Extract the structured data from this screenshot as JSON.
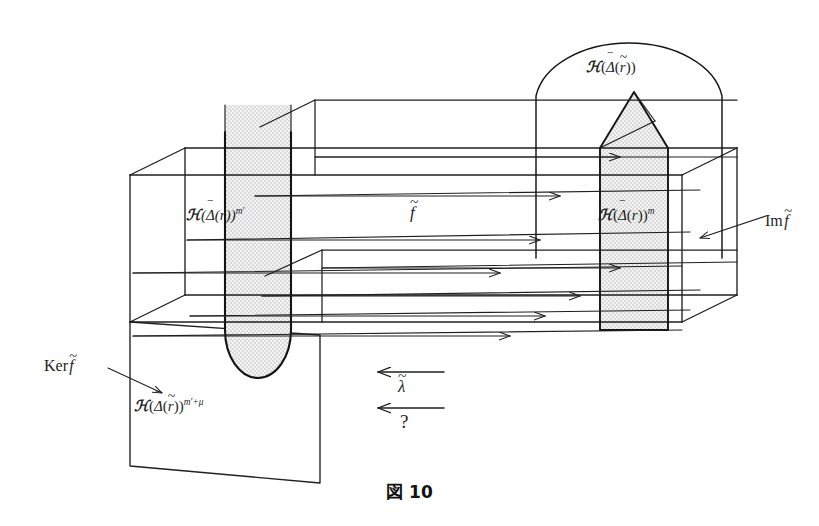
{
  "figure": {
    "caption": "図 10",
    "caption_number": "10",
    "caption_prefix": "図",
    "background_color": "#ffffff",
    "ink_color": "#1f1f1f",
    "shade_color": "#e3e3e3"
  },
  "labels": {
    "left_slab": {
      "script": "ℋ",
      "open": "(",
      "delta": "Δ",
      "delta_accent": "‾",
      "inner_open": "(",
      "r": "r",
      "r_accent": "",
      "inner_close": ")",
      "close": ")",
      "exponent": "m′",
      "plain": "ℋ(Δ̄(r))^{m′}"
    },
    "right_slab": {
      "script": "ℋ",
      "delta": "Δ",
      "delta_accent": "‾",
      "r": "r",
      "r_accent": "",
      "exponent": "m",
      "plain": "ℋ(Δ̄(r))^{m}"
    },
    "arch": {
      "script": "ℋ",
      "delta": "Δ",
      "delta_accent": "‾",
      "r": "r",
      "r_accent": "~",
      "exponent": "",
      "plain": "ℋ(Δ̄(r̃))"
    },
    "kernel_plane": {
      "script": "ℋ",
      "delta": "Δ",
      "delta_accent": "‾",
      "r": "r",
      "r_accent": "~",
      "exponent": "m′+μ",
      "plain": "ℋ(Δ̄(r̃))^{m′+μ}"
    },
    "map_f": {
      "symbol": "f",
      "accent": "~",
      "plain": "f̃"
    },
    "ker": {
      "word": "Ker",
      "symbol": "f",
      "accent": "~",
      "plain": "Ker f̃"
    },
    "im": {
      "word": "Im",
      "symbol": "f",
      "accent": "~",
      "plain": "Im f̃"
    },
    "lambda": {
      "symbol": "λ",
      "accent": "~",
      "plain": "λ̃"
    },
    "question": "?"
  },
  "geometry": {
    "box": {
      "front_left_x": 130,
      "front_right_x": 682,
      "front_top_y": 175,
      "front_bottom_y": 322,
      "depth_dx": 55,
      "depth_dy": -27
    },
    "arrow_rows_top": 4,
    "arrow_rows_bottom": 4,
    "u_shape": {
      "left": 225,
      "right": 291,
      "top": 105,
      "bottom": 378
    },
    "pentagon": {
      "left": 600,
      "right": 668,
      "peak_y": 92,
      "bottom_y": 330
    },
    "arch": {
      "left": 536,
      "right": 722,
      "peak_y": 35,
      "base_y": 250
    },
    "kernel_plane": {
      "top_left_x": 130,
      "top_left_y": 322
    }
  }
}
